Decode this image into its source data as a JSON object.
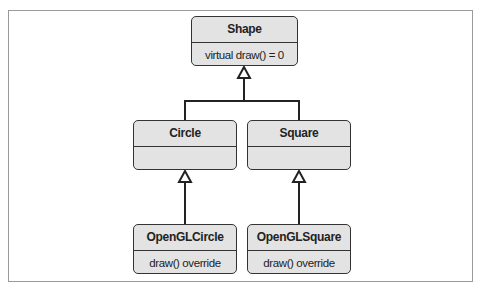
{
  "diagram": {
    "type": "UML class diagram (inheritance)",
    "classes": [
      {
        "id": "shape",
        "name": "Shape",
        "operations": "virtual draw() = 0"
      },
      {
        "id": "circle",
        "name": "Circle",
        "operations": ""
      },
      {
        "id": "square",
        "name": "Square",
        "operations": ""
      },
      {
        "id": "openglcircle",
        "name": "OpenGLCircle",
        "operations": "draw() override"
      },
      {
        "id": "openglsquare",
        "name": "OpenGLSquare",
        "operations": "draw() override"
      }
    ],
    "relations": [
      {
        "from": "Circle",
        "to": "Shape",
        "kind": "generalization"
      },
      {
        "from": "Square",
        "to": "Shape",
        "kind": "generalization"
      },
      {
        "from": "OpenGLCircle",
        "to": "Circle",
        "kind": "generalization"
      },
      {
        "from": "OpenGLSquare",
        "to": "Square",
        "kind": "generalization"
      }
    ],
    "colors": {
      "box_fill": "#e3e3e3",
      "stroke": "#333333",
      "frame": "#9a9a9a"
    }
  }
}
